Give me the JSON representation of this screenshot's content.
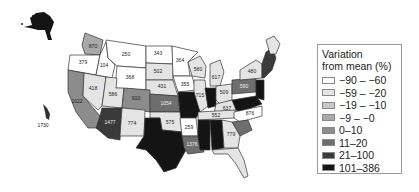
{
  "legend": {
    "title_line1": "Variation",
    "title_line2": "from mean (%)",
    "items": [
      {
        "label": "−90 – −60",
        "color": "#ffffff"
      },
      {
        "label": "−59 – −20",
        "color": "#e4e4e4"
      },
      {
        "label": "−19 – −10",
        "color": "#c8c8c8"
      },
      {
        "label": "−9 – −0",
        "color": "#a8a8a8"
      },
      {
        "label": "0–10",
        "color": "#8c8c8c"
      },
      {
        "label": "11–20",
        "color": "#6e6e6e"
      },
      {
        "label": "21–100",
        "color": "#3a3a3a"
      },
      {
        "label": "101–386",
        "color": "#141414"
      }
    ]
  },
  "states": {
    "WA": "870",
    "OR": "379",
    "ID": "104",
    "MT": "250",
    "WY": "368",
    "ND": "343",
    "SD": "502",
    "NE": "431",
    "MN": "364",
    "IA": "355",
    "WI": "580",
    "MI": "617",
    "IL": "715",
    "OH": "509",
    "PA": "590",
    "NY": "480",
    "NV": "418",
    "UT": "586",
    "CO": "900",
    "KS": "1054",
    "CA": "1022",
    "AZ": "1477",
    "NM": "774",
    "OK": "575",
    "AR": "259",
    "TN": "552",
    "NC": "876",
    "GA": "779",
    "KY": "637",
    "LA": "1376",
    "HI": "1730"
  }
}
